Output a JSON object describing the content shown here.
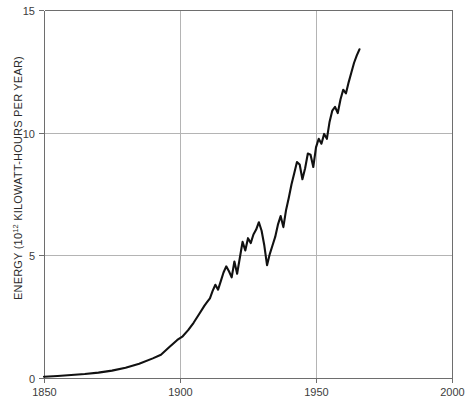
{
  "chart_data": {
    "type": "line",
    "title": "",
    "subtitle": "",
    "xlabel": "",
    "ylabel": "ENERGY (10¹² KILOWATT-HOURS PER YEAR)",
    "ylabel_parts": {
      "prefix": "ENERGY (10",
      "exponent": "12",
      "suffix": " KILOWATT-HOURS PER YEAR)"
    },
    "xlim": [
      1850,
      2000
    ],
    "ylim": [
      0,
      15
    ],
    "grid": true,
    "legend": "none",
    "xticks": [
      1850,
      1900,
      1950,
      2000
    ],
    "xtick_labels": [
      "1850",
      "1900",
      "1950",
      "2000"
    ],
    "yticks": [
      0,
      5,
      10,
      15
    ],
    "ytick_labels": [
      "0",
      "5",
      "10",
      "15"
    ],
    "units": "10^12 kilowatt-hours per year",
    "series": [
      {
        "name": "World energy consumption",
        "color": "#111111",
        "x": [
          1850,
          1855,
          1860,
          1865,
          1870,
          1875,
          1880,
          1885,
          1890,
          1893,
          1896,
          1899,
          1901,
          1903,
          1905,
          1907,
          1909,
          1910,
          1911,
          1912,
          1913,
          1914,
          1915,
          1916,
          1917,
          1918,
          1919,
          1920,
          1921,
          1922,
          1923,
          1924,
          1925,
          1926,
          1927,
          1928,
          1929,
          1930,
          1931,
          1932,
          1933,
          1934,
          1935,
          1936,
          1937,
          1938,
          1939,
          1940,
          1941,
          1942,
          1943,
          1944,
          1945,
          1946,
          1947,
          1948,
          1949,
          1950,
          1951,
          1952,
          1953,
          1954,
          1955,
          1956,
          1957,
          1958,
          1959,
          1960,
          1961,
          1962,
          1963,
          1964,
          1965,
          1966
        ],
        "y": [
          0.05,
          0.08,
          0.12,
          0.16,
          0.22,
          0.3,
          0.42,
          0.58,
          0.8,
          0.95,
          1.25,
          1.55,
          1.7,
          1.95,
          2.25,
          2.6,
          2.95,
          3.1,
          3.25,
          3.55,
          3.8,
          3.6,
          3.95,
          4.3,
          4.55,
          4.35,
          4.1,
          4.75,
          4.25,
          4.9,
          5.55,
          5.2,
          5.7,
          5.5,
          5.85,
          6.05,
          6.35,
          6.0,
          5.4,
          4.6,
          5.05,
          5.4,
          5.75,
          6.25,
          6.6,
          6.15,
          6.85,
          7.35,
          7.9,
          8.35,
          8.8,
          8.7,
          8.1,
          8.55,
          9.15,
          9.1,
          8.6,
          9.4,
          9.75,
          9.55,
          9.95,
          9.75,
          10.45,
          10.9,
          11.05,
          10.8,
          11.35,
          11.75,
          11.6,
          12.05,
          12.45,
          12.85,
          13.15,
          13.4
        ]
      }
    ]
  }
}
